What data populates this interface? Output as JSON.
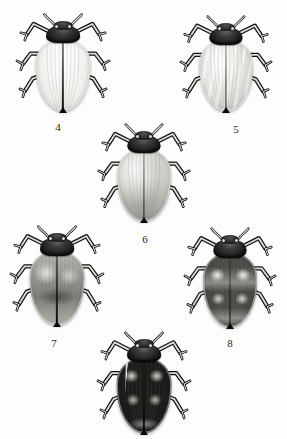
{
  "plate": {
    "kind": "entomological-plate",
    "subject": "ladybird beetles, dorsal view",
    "background_color": "#fdfdfd",
    "label_color": "#1f1f1f",
    "specimen_count": 6,
    "labels_visible": [
      "4",
      "5",
      "6",
      "7",
      "8"
    ]
  },
  "specimens": [
    {
      "id": "specimen-4",
      "label": "4",
      "label_x": 58,
      "label_y": 122,
      "x": 14,
      "y": 12,
      "w": 98,
      "h": 104,
      "elytra_tone": "#f2f1ee",
      "elytra_shade": "#dcdbd6",
      "pattern": "immaculate pale",
      "description": "very pale cream elytra, unmarked, dark pronotum"
    },
    {
      "id": "specimen-5",
      "label": "5",
      "label_x": 236,
      "label_y": 124,
      "x": 178,
      "y": 14,
      "w": 96,
      "h": 102,
      "elytra_tone": "#e2e1dc",
      "elytra_shade": "#bdbcb6",
      "pattern": "faint longitudinal streaks",
      "description": "light grey elytra with soft vertical streaking"
    },
    {
      "id": "specimen-6",
      "label": "6",
      "label_x": 145,
      "label_y": 234,
      "x": 96,
      "y": 122,
      "w": 96,
      "h": 104,
      "elytra_tone": "#cfcec8",
      "elytra_shade": "#9b9a93",
      "pattern": "uniform mid grey",
      "description": "medium grey elytra, pale margins, slight mottling"
    },
    {
      "id": "specimen-7",
      "label": "7",
      "label_x": 54,
      "label_y": 338,
      "x": 8,
      "y": 224,
      "w": 98,
      "h": 106,
      "elytra_tone": "#b9b8b1",
      "elytra_shade": "#7d7c76",
      "pattern": "mottled dark grey",
      "description": "darker mottled elytra with broad pale lateral margins"
    },
    {
      "id": "specimen-8",
      "label": "8",
      "label_x": 230,
      "label_y": 338,
      "x": 182,
      "y": 226,
      "w": 96,
      "h": 106,
      "elytra_tone": "#8d8c86",
      "elytra_shade": "#4a4a46",
      "pattern": "dark transverse bands with pale spots",
      "description": "dark elytra banded, pale humeral and median patches"
    },
    {
      "id": "specimen-9",
      "label": "",
      "label_x": 143,
      "label_y": 440,
      "x": 95,
      "y": 330,
      "w": 98,
      "h": 108,
      "elytra_tone": "#4f4e4a",
      "elytra_shade": "#1d1d1b",
      "pattern": "black with pale spots",
      "description": "nearly black elytra with pale shoulder streaks and paired light spots; number label cropped off below image edge"
    }
  ]
}
